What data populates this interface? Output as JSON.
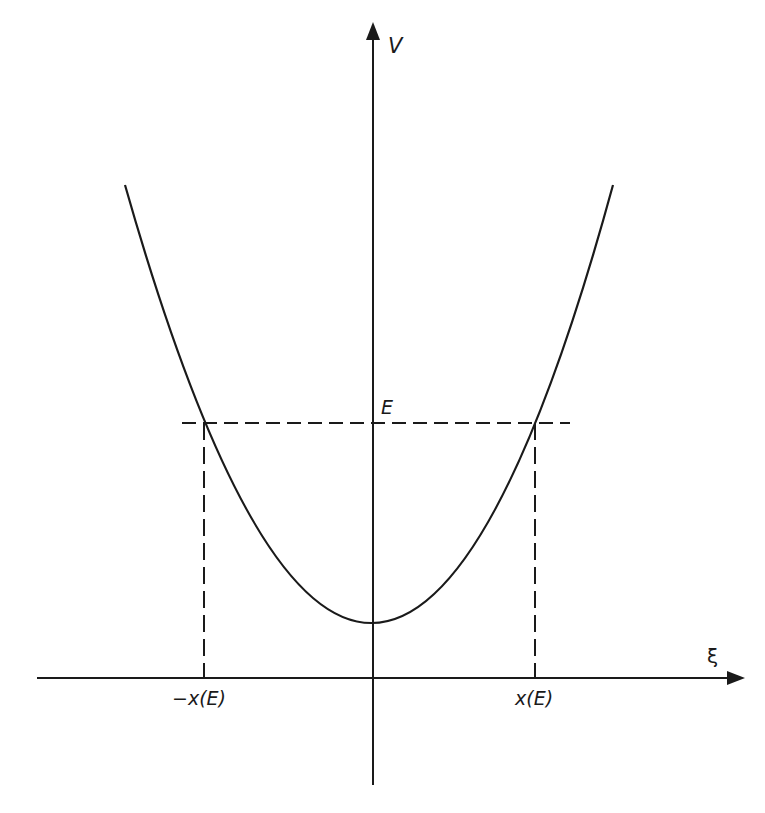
{
  "diagram": {
    "type": "potential-well",
    "colors": {
      "line": "#1a1a1a",
      "background": "#ffffff"
    },
    "axes": {
      "vertical_label": "V",
      "horizontal_label": "ξ"
    },
    "labels": {
      "energy": "E",
      "left_turning_point": "−x(E)",
      "right_turning_point": "x(E)"
    },
    "curve": {
      "kind": "parabola",
      "vertex_px": [
        374,
        623
      ],
      "left_end_px": [
        125,
        185
      ],
      "right_end_px": [
        613,
        185
      ]
    },
    "energy_line": {
      "style": "dashed",
      "y_px": 423,
      "x_start_px": 182,
      "x_end_px": 570
    },
    "turning_points_px": {
      "left_x": 204,
      "right_x": 535
    }
  }
}
